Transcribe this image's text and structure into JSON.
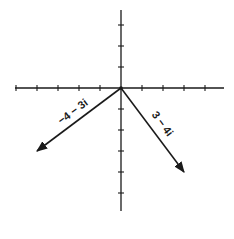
{
  "diagram": {
    "type": "complex-plane-vectors",
    "origin_px": [
      121,
      88
    ],
    "unit_px": 21,
    "axes": {
      "x": {
        "min": -5,
        "max": 4,
        "ticks": [
          -5,
          -4,
          -3,
          -2,
          -1,
          1,
          2,
          3,
          4
        ]
      },
      "y": {
        "min": -5,
        "max": 3,
        "ticks": [
          3,
          2,
          1,
          -1,
          -2,
          -3,
          -4,
          -5
        ]
      }
    },
    "vectors": [
      {
        "label": "−4 − 3i",
        "re": -4,
        "im": -3
      },
      {
        "label": "3 − 4i",
        "re": 3,
        "im": -4
      }
    ],
    "colors": {
      "ink": "#1a1a1a",
      "background": "#ffffff"
    }
  }
}
